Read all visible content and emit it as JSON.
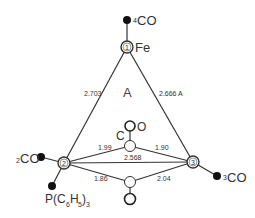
{
  "diagram": {
    "title_region": "A",
    "atoms": {
      "fe1": {
        "number": "1",
        "label": "Fe"
      },
      "fe2": {
        "number": "2"
      },
      "fe3": {
        "number": "3"
      },
      "bridge_c_label": "C",
      "bridge_o_label": "O"
    },
    "ligands": {
      "co4": {
        "prefix": "4",
        "label": "CO"
      },
      "co2": {
        "prefix": "2",
        "label": "CO"
      },
      "co3": {
        "prefix": "3",
        "label": "CO"
      },
      "phosphine": {
        "label": "P(C",
        "sub1": "6",
        "mid": "H",
        "sub2": "5",
        "close": ")",
        "sub3": "3"
      }
    },
    "distances": {
      "fe1_fe2": "2.703",
      "fe1_fe3": "2.666 A",
      "fe2_fe3": "2.568",
      "fe2_c_upper": "1.99",
      "fe3_c_upper": "1.90",
      "fe2_c_lower": "1.86",
      "fe3_c_lower": "2.04"
    },
    "colors": {
      "line": "#333333",
      "filled_atom": "#111111",
      "open_atom": "#ffffff"
    }
  }
}
